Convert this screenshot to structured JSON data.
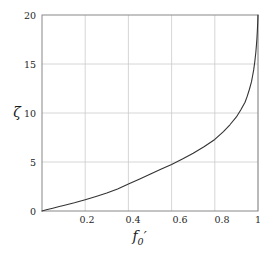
{
  "figure": {
    "background_color": "#ffffff",
    "axes_color": "#808080",
    "grid_color": "#cccccc",
    "curve_color": "#333333"
  },
  "axis": {
    "x": {
      "label_f": "f",
      "label_sub": "0",
      "label_prime": "′",
      "ticks": [
        "0.2",
        "0.4",
        "0.6",
        "0.8",
        "1"
      ],
      "tick_values": [
        0.2,
        0.4,
        0.6,
        0.8,
        1.0
      ],
      "range": [
        0,
        1
      ]
    },
    "y": {
      "label": "ζ",
      "ticks": [
        "0",
        "5",
        "10",
        "15",
        "20"
      ],
      "tick_values": [
        0,
        5,
        10,
        15,
        20
      ],
      "range": [
        0,
        20
      ]
    }
  },
  "chart_data": {
    "type": "line",
    "title": "",
    "xlabel": "f′0",
    "ylabel": "ζ",
    "xlim": [
      0,
      1
    ],
    "ylim": [
      0,
      20
    ],
    "grid": true,
    "legend": null,
    "xticks": [
      0.2,
      0.4,
      0.6,
      0.8,
      1.0
    ],
    "yticks": [
      0,
      5,
      10,
      15,
      20
    ],
    "series": [
      {
        "name": "zeta(f0')",
        "color": "#333333",
        "x": [
          0.0,
          0.02,
          0.05,
          0.08,
          0.1,
          0.15,
          0.2,
          0.25,
          0.3,
          0.35,
          0.4,
          0.45,
          0.5,
          0.55,
          0.6,
          0.65,
          0.7,
          0.75,
          0.8,
          0.84,
          0.87,
          0.9,
          0.92,
          0.94,
          0.95,
          0.96,
          0.97,
          0.975,
          0.98,
          0.985,
          0.99,
          0.993,
          0.995,
          0.997,
          0.998,
          0.999,
          1.0
        ],
        "y": [
          0.0,
          0.12,
          0.28,
          0.45,
          0.56,
          0.84,
          1.15,
          1.48,
          1.83,
          2.25,
          2.75,
          3.25,
          3.75,
          4.25,
          4.75,
          5.3,
          5.9,
          6.55,
          7.3,
          8.1,
          8.8,
          9.6,
          10.3,
          11.1,
          11.7,
          12.4,
          13.2,
          13.8,
          14.4,
          15.2,
          16.2,
          17.0,
          17.6,
          18.4,
          18.9,
          19.4,
          20.0
        ]
      }
    ]
  },
  "plot_geometry": {
    "left": 42,
    "right": 258,
    "top": 15,
    "bottom": 211
  }
}
